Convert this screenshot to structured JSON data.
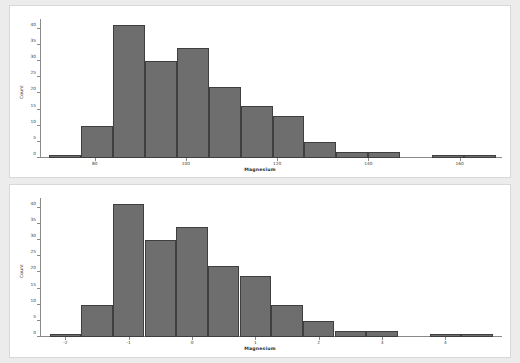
{
  "figure": {
    "background_color": "#ececed",
    "panel_background": "#ffffff",
    "bar_fill": "#6e6e6e",
    "bar_edge": "#3f3f3f",
    "axis_color": "#8a8a8a"
  },
  "chart_data": [
    {
      "type": "bar",
      "subtype": "histogram",
      "panel": "top",
      "title": "",
      "xlabel": "Magnesium",
      "ylabel": "Count",
      "xlim": [
        68,
        168
      ],
      "ylim": [
        0,
        43
      ],
      "grid": false,
      "legend": null,
      "xticks": [
        80,
        100,
        120,
        140,
        160
      ],
      "xtick_labels": [
        "80",
        "100",
        "120",
        "140",
        "160"
      ],
      "yticks": [
        0,
        5,
        10,
        15,
        20,
        25,
        30,
        35,
        40
      ],
      "ytick_labels": [
        "0",
        "5",
        "10",
        "15",
        "20",
        "25",
        "30",
        "35",
        "40"
      ],
      "bin_edges": [
        70,
        77,
        84,
        91,
        98,
        105,
        112,
        119,
        126,
        133,
        140,
        147,
        154,
        161,
        168
      ],
      "bin_centers": [
        73.5,
        80.5,
        87.5,
        94.5,
        101.5,
        108.5,
        115.5,
        122.5,
        129.5,
        136.5,
        143.5,
        150.5,
        157.5,
        164.5
      ],
      "values": [
        1,
        10,
        41,
        30,
        34,
        22,
        16,
        13,
        5,
        2,
        2,
        0,
        1,
        1
      ]
    },
    {
      "type": "bar",
      "subtype": "histogram",
      "panel": "bottom",
      "title": "",
      "xlabel": "Magnesium",
      "ylabel": "Count",
      "xlim": [
        -2.4,
        4.8
      ],
      "ylim": [
        0,
        43
      ],
      "grid": false,
      "legend": null,
      "xticks": [
        -2,
        -1,
        0,
        1,
        2,
        3,
        4
      ],
      "xtick_labels": [
        "-2",
        "-1",
        "0",
        "1",
        "2",
        "3",
        "4"
      ],
      "yticks": [
        0,
        5,
        10,
        15,
        20,
        25,
        30,
        35,
        40
      ],
      "ytick_labels": [
        "0",
        "5",
        "10",
        "15",
        "20",
        "25",
        "30",
        "35",
        "40"
      ],
      "bin_edges": [
        -2.25,
        -1.75,
        -1.25,
        -0.75,
        -0.25,
        0.25,
        0.75,
        1.25,
        1.75,
        2.25,
        2.75,
        3.25,
        3.75,
        4.25,
        4.75
      ],
      "bin_centers": [
        -2.0,
        -1.5,
        -1.0,
        -0.5,
        0.0,
        0.5,
        1.0,
        1.5,
        2.0,
        2.5,
        3.0,
        3.5,
        4.0,
        4.5
      ],
      "values": [
        1,
        10,
        41,
        30,
        34,
        22,
        19,
        10,
        5,
        2,
        2,
        0,
        1,
        1
      ]
    }
  ]
}
